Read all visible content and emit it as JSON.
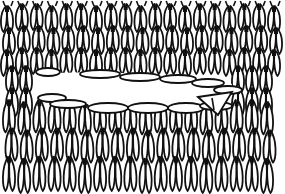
{
  "figure": {
    "style": "black line art on white",
    "colors": {
      "line": "#111111",
      "background": "#ffffff"
    },
    "upper_fabric": {
      "columns": 19,
      "rows": 3,
      "x_start": 8,
      "x_end": 275,
      "y_top": 4,
      "y_bottom": 70
    },
    "buttonhole": {
      "x_start": 35,
      "x_end": 232,
      "y_top": 70,
      "y_bottom": 108
    },
    "lower_fabric": {
      "columns": 18,
      "rows": 3,
      "x_start": 10,
      "x_end": 268,
      "y_top": 100,
      "y_bottom": 185
    }
  }
}
